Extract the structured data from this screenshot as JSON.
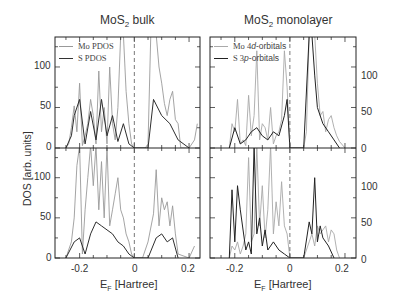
{
  "figure": {
    "panels": [
      {
        "id": "bulk",
        "title_main": "MoS",
        "title_sub": "2",
        "title_rest": " bulk",
        "legend": [
          {
            "label": "Mo PDOS",
            "color": "#9a9a9a"
          },
          {
            "label": "S PDOS",
            "color": "#333333"
          }
        ],
        "xticks": [
          "-0.2",
          "0",
          "0.2"
        ],
        "yticks": [
          "100",
          "50",
          "0"
        ],
        "xlabel_main": "E",
        "xlabel_sub": "F",
        "xlabel_rest": " [Hartree]"
      },
      {
        "id": "monolayer",
        "title_main": "MoS",
        "title_sub": "2",
        "title_rest": " monolayer",
        "legend": [
          {
            "label_pre": "Mo 4",
            "label_ital": "d",
            "label_post": "-orbitals",
            "color": "#9a9a9a"
          },
          {
            "label_pre": "S 3",
            "label_ital": "p",
            "label_post": "-orbitals",
            "color": "#333333"
          }
        ],
        "xticks": [
          "-0.2",
          "0",
          "0.2"
        ],
        "yticks": [
          "100",
          "50",
          "0"
        ],
        "xlabel_main": "E",
        "xlabel_sub": "F",
        "xlabel_rest": " [Hartree]"
      }
    ],
    "ylabel": "DOS [arb. units]"
  },
  "chart_data": [
    {
      "type": "line",
      "title": "MoS2 bulk (upper: spin up / lower: spin down)",
      "xlabel": "E_F [Hartree]",
      "ylabel": "DOS [arb. units]",
      "xlim": [
        -0.29,
        0.24
      ],
      "ylim": [
        0,
        137
      ],
      "xticks": [
        -0.2,
        0,
        0.2
      ],
      "yticks": [
        0,
        50,
        100
      ],
      "fermi_level_dashed_line": 0,
      "upper": {
        "series": [
          {
            "name": "Mo PDOS",
            "x": [
              -0.25,
              -0.24,
              -0.23,
              -0.22,
              -0.21,
              -0.2,
              -0.19,
              -0.18,
              -0.17,
              -0.16,
              -0.15,
              -0.14,
              -0.13,
              -0.12,
              -0.11,
              -0.1,
              -0.09,
              -0.08,
              -0.07,
              -0.06,
              -0.05,
              -0.04,
              -0.03,
              -0.02,
              -0.01,
              0.0,
              0.01,
              0.02,
              0.03,
              0.04,
              0.05,
              0.06,
              0.07,
              0.08,
              0.09,
              0.1,
              0.11,
              0.12,
              0.13,
              0.14,
              0.15,
              0.16,
              0.17,
              0.2,
              0.22,
              0.23
            ],
            "y": [
              0,
              5,
              25,
              52,
              20,
              80,
              3,
              15,
              30,
              60,
              40,
              5,
              95,
              20,
              50,
              5,
              100,
              30,
              10,
              50,
              140,
              140,
              70,
              30,
              5,
              0,
              0,
              0,
              0,
              0,
              5,
              140,
              140,
              140,
              100,
              80,
              55,
              40,
              60,
              70,
              35,
              30,
              0,
              0,
              10,
              30
            ]
          },
          {
            "name": "S PDOS",
            "x": [
              -0.25,
              -0.23,
              -0.22,
              -0.2,
              -0.18,
              -0.16,
              -0.14,
              -0.12,
              -0.1,
              -0.08,
              -0.06,
              -0.04,
              -0.02,
              0.0,
              0.05,
              0.07,
              0.1,
              0.13,
              0.16,
              0.2
            ],
            "y": [
              0,
              15,
              40,
              60,
              5,
              45,
              10,
              60,
              15,
              40,
              8,
              30,
              5,
              0,
              0,
              60,
              40,
              30,
              10,
              0
            ]
          }
        ]
      },
      "lower": {
        "series": [
          {
            "name": "Mo PDOS",
            "x": [
              -0.25,
              -0.23,
              -0.22,
              -0.21,
              -0.2,
              -0.19,
              -0.18,
              -0.17,
              -0.16,
              -0.15,
              -0.14,
              -0.13,
              -0.12,
              -0.11,
              -0.1,
              -0.09,
              -0.08,
              -0.07,
              -0.06,
              -0.05,
              -0.04,
              -0.03,
              -0.02,
              -0.01,
              0.0,
              0.03,
              0.05,
              0.07,
              0.08,
              0.09,
              0.1,
              0.11,
              0.12,
              0.13,
              0.14,
              0.15,
              0.16,
              0.2,
              0.22
            ],
            "y": [
              0,
              20,
              50,
              115,
              140,
              5,
              60,
              100,
              140,
              90,
              140,
              60,
              120,
              50,
              140,
              40,
              60,
              80,
              100,
              60,
              50,
              30,
              20,
              5,
              0,
              0,
              20,
              55,
              110,
              40,
              75,
              60,
              70,
              40,
              65,
              30,
              5,
              0,
              15
            ]
          },
          {
            "name": "S PDOS",
            "x": [
              -0.25,
              -0.22,
              -0.2,
              -0.18,
              -0.16,
              -0.14,
              -0.12,
              -0.1,
              -0.08,
              -0.06,
              -0.04,
              -0.02,
              0.0,
              0.05,
              0.08,
              0.1,
              0.12,
              0.14,
              0.16
            ],
            "y": [
              0,
              20,
              25,
              5,
              30,
              45,
              40,
              35,
              30,
              20,
              15,
              5,
              0,
              0,
              25,
              30,
              20,
              25,
              0
            ]
          }
        ]
      }
    },
    {
      "type": "line",
      "title": "MoS2 monolayer (upper: spin up / lower: spin down)",
      "xlabel": "E_F [Hartree]",
      "ylabel": "DOS [arb. units]",
      "xlim": [
        -0.29,
        0.24
      ],
      "ylim": [
        0,
        137
      ],
      "xticks": [
        -0.2,
        0,
        0.2
      ],
      "yticks": [
        0,
        50,
        100
      ],
      "fermi_level_dashed_line": 0,
      "upper": {
        "series": [
          {
            "name": "Mo 4d-orbitals",
            "x": [
              -0.22,
              -0.21,
              -0.2,
              -0.19,
              -0.18,
              -0.17,
              -0.16,
              -0.15,
              -0.14,
              -0.13,
              -0.12,
              -0.11,
              -0.1,
              -0.09,
              -0.08,
              -0.07,
              -0.06,
              -0.05,
              -0.04,
              -0.03,
              -0.02,
              -0.01,
              0.0,
              0.05,
              0.06,
              0.07,
              0.08,
              0.09,
              0.1,
              0.11,
              0.12,
              0.13,
              0.14,
              0.15,
              0.16,
              0.17,
              0.18,
              0.2
            ],
            "y": [
              0,
              30,
              20,
              60,
              5,
              10,
              3,
              65,
              15,
              40,
              120,
              10,
              30,
              25,
              10,
              50,
              5,
              15,
              20,
              35,
              120,
              75,
              0,
              0,
              20,
              140,
              140,
              140,
              80,
              40,
              45,
              20,
              35,
              40,
              25,
              15,
              8,
              0
            ]
          },
          {
            "name": "S 3p-orbitals",
            "x": [
              -0.22,
              -0.2,
              -0.18,
              -0.16,
              -0.14,
              -0.12,
              -0.1,
              -0.08,
              -0.06,
              -0.04,
              -0.02,
              -0.01,
              0.0,
              0.05,
              0.07,
              0.08,
              0.09,
              0.1,
              0.12,
              0.14,
              0.16,
              0.18
            ],
            "y": [
              0,
              25,
              5,
              10,
              20,
              25,
              15,
              10,
              20,
              15,
              40,
              60,
              0,
              0,
              140,
              140,
              90,
              50,
              30,
              20,
              10,
              0
            ]
          }
        ]
      },
      "lower": {
        "series": [
          {
            "name": "Mo 4d-orbitals",
            "x": [
              -0.22,
              -0.21,
              -0.2,
              -0.19,
              -0.18,
              -0.17,
              -0.16,
              -0.15,
              -0.14,
              -0.13,
              -0.12,
              -0.11,
              -0.1,
              -0.09,
              -0.08,
              -0.07,
              -0.06,
              -0.05,
              -0.04,
              -0.03,
              -0.02,
              -0.01,
              0.0,
              0.05,
              0.07,
              0.08,
              0.09,
              0.1,
              0.11,
              0.12,
              0.13,
              0.14,
              0.15,
              0.16,
              0.17,
              0.18
            ],
            "y": [
              0,
              15,
              10,
              20,
              5,
              15,
              30,
              125,
              20,
              30,
              140,
              40,
              90,
              25,
              60,
              140,
              30,
              70,
              40,
              95,
              40,
              30,
              0,
              0,
              20,
              30,
              15,
              40,
              30,
              35,
              40,
              20,
              35,
              30,
              10,
              0
            ]
          },
          {
            "name": "S 3p-orbitals",
            "x": [
              -0.22,
              -0.21,
              -0.2,
              -0.19,
              -0.18,
              -0.16,
              -0.15,
              -0.14,
              -0.13,
              -0.12,
              -0.11,
              -0.1,
              -0.09,
              -0.08,
              -0.06,
              -0.04,
              -0.02,
              0.0,
              0.05,
              0.07,
              0.08,
              0.09,
              0.1,
              0.11,
              0.12,
              0.14,
              0.16
            ],
            "y": [
              0,
              85,
              20,
              90,
              60,
              10,
              20,
              5,
              140,
              30,
              50,
              15,
              35,
              10,
              20,
              10,
              5,
              0,
              0,
              45,
              30,
              100,
              20,
              40,
              25,
              15,
              0
            ]
          }
        ]
      }
    }
  ]
}
